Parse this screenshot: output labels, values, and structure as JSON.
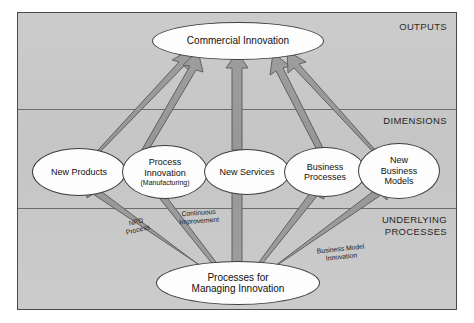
{
  "figure": {
    "zones": [
      {
        "id": "outputs",
        "label": "OUTPUTS"
      },
      {
        "id": "dimensions",
        "label": "DIMENSIONS"
      },
      {
        "id": "underlying",
        "label": "UNDERLYING\nPROCESSES"
      }
    ],
    "nodes": {
      "top": {
        "label": "Commercial Innovation"
      },
      "dimension_1": {
        "line1": "New Products"
      },
      "dimension_2": {
        "line1": "Process",
        "line2": "Innovation",
        "line3": "(Manufacturing)"
      },
      "dimension_3": {
        "line1": "New Services"
      },
      "dimension_4": {
        "line1": "Business",
        "line2": "Processes"
      },
      "dimension_5": {
        "line1": "New",
        "line2": "Business",
        "line3": "Models"
      },
      "bottom": {
        "line1": "Processes for",
        "line2": "Managing Innovation"
      }
    },
    "edge_labels": {
      "npd": "NPD\nProcess",
      "continuous": "Continuous\nImprovement",
      "business_model": "Business Model\nInnovation"
    },
    "colors": {
      "panel_background": "#c9c9c9",
      "panel_border": "#4a4a4a",
      "divider": "#6c6c6c",
      "node_fill": "#fdfdfd",
      "node_border": "#3d3d3d",
      "arrow_fill": "#9a9a9a",
      "arrow_border": "#5e5e5e",
      "text": "#101010"
    }
  }
}
